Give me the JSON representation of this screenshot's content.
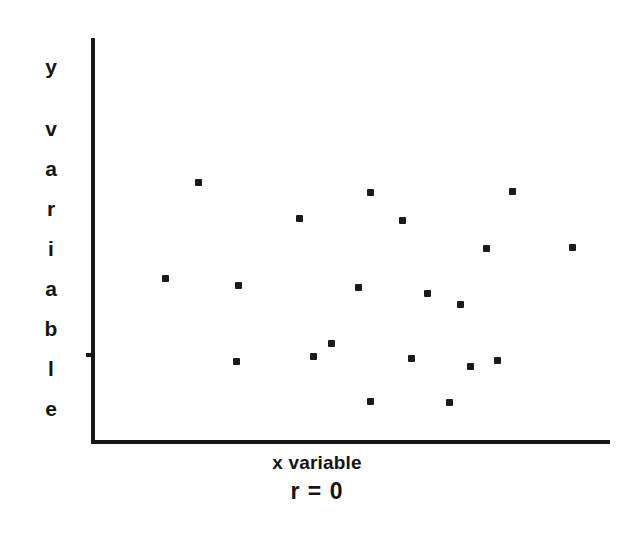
{
  "chart_data": {
    "type": "scatter",
    "title": "",
    "subtitle": "",
    "xlabel": "x variable",
    "ylabel": "y variable",
    "annotation": "r = 0",
    "grid": false,
    "legend": null,
    "axis_color": "#161616",
    "point_color": "#1a1a1a",
    "background": "#ffffff",
    "xlim": [
      0,
      100
    ],
    "ylim": [
      0,
      100
    ],
    "axis_ticks_visible": false,
    "tick_labels": {
      "x": [],
      "y": []
    },
    "n_points": 19,
    "points": [
      {
        "x": 20.7,
        "y": 64.3
      },
      {
        "x": 53.8,
        "y": 61.8
      },
      {
        "x": 81.1,
        "y": 61.9
      },
      {
        "x": 39.7,
        "y": 55.2
      },
      {
        "x": 59.9,
        "y": 54.7
      },
      {
        "x": 76.1,
        "y": 47.8
      },
      {
        "x": 92.7,
        "y": 48.0
      },
      {
        "x": 14.3,
        "y": 40.4
      },
      {
        "x": 28.3,
        "y": 38.7
      },
      {
        "x": 51.3,
        "y": 38.2
      },
      {
        "x": 64.6,
        "y": 36.7
      },
      {
        "x": 71.0,
        "y": 33.9
      },
      {
        "x": 45.9,
        "y": 24.1
      },
      {
        "x": 42.4,
        "y": 20.9
      },
      {
        "x": 27.9,
        "y": 19.6
      },
      {
        "x": 61.3,
        "y": 20.4
      },
      {
        "x": 72.7,
        "y": 18.4
      },
      {
        "x": 77.9,
        "y": 19.9
      },
      {
        "x": 53.6,
        "y": 9.7
      }
    ],
    "extra_points": [
      {
        "x": 68.8,
        "y": 9.5
      }
    ],
    "pixel_points": [
      {
        "px": 198,
        "py": 182
      },
      {
        "px": 370,
        "py": 192
      },
      {
        "px": 512,
        "py": 191
      },
      {
        "px": 299,
        "py": 218
      },
      {
        "px": 402,
        "py": 220
      },
      {
        "px": 486,
        "py": 248
      },
      {
        "px": 572,
        "py": 247
      },
      {
        "px": 165,
        "py": 278
      },
      {
        "px": 238,
        "py": 285
      },
      {
        "px": 358,
        "py": 287
      },
      {
        "px": 427,
        "py": 293
      },
      {
        "px": 460,
        "py": 304
      },
      {
        "px": 331,
        "py": 343
      },
      {
        "px": 313,
        "py": 356
      },
      {
        "px": 236,
        "py": 361
      },
      {
        "px": 411,
        "py": 358
      },
      {
        "px": 470,
        "py": 366
      },
      {
        "px": 497,
        "py": 360
      },
      {
        "px": 370,
        "py": 401
      },
      {
        "px": 449,
        "py": 402
      }
    ]
  },
  "labels": {
    "y_axis_letters": [
      "y",
      "v",
      "a",
      "r",
      "i",
      "a",
      "b",
      "l",
      "e"
    ],
    "x_axis_caption": "x variable",
    "correlation_caption": "r = 0"
  }
}
